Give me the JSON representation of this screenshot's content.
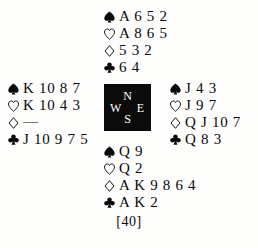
{
  "diagram": {
    "type": "bridge-deal",
    "caption": "[40]",
    "compass": {
      "north": "N",
      "west": "W",
      "east": "E",
      "south": "S",
      "background_color": "#0b0b0b",
      "text_color": "#ffffff"
    },
    "suits": [
      {
        "key": "spades",
        "symbol": "♠",
        "icon": "spade-icon",
        "fill": "solid",
        "color": "#0a0a0a"
      },
      {
        "key": "hearts",
        "symbol": "♡",
        "icon": "heart-icon",
        "fill": "outline",
        "color": "#0a0a0a"
      },
      {
        "key": "diamonds",
        "symbol": "♢",
        "icon": "diamond-icon",
        "fill": "outline",
        "color": "#0a0a0a"
      },
      {
        "key": "clubs",
        "symbol": "♣",
        "icon": "club-icon",
        "fill": "solid",
        "color": "#0a0a0a"
      }
    ],
    "hands": {
      "north": {
        "label": "North",
        "spades": "A 6 5 2",
        "hearts": "A 8 6 5",
        "diamonds": "5 3 2",
        "clubs": "6 4"
      },
      "west": {
        "label": "West",
        "spades": "K 10 8 7",
        "hearts": "K 10 4 3",
        "diamonds": "—",
        "clubs": "J 10 9 7 5"
      },
      "east": {
        "label": "East",
        "spades": "J 4 3",
        "hearts": "J 9 7",
        "diamonds": "Q J 10 7",
        "clubs": "Q 8 3"
      },
      "south": {
        "label": "South",
        "spades": "Q 9",
        "hearts": "Q 2",
        "diamonds": "A K 9 8 6 4",
        "clubs": "A K 2"
      }
    }
  }
}
